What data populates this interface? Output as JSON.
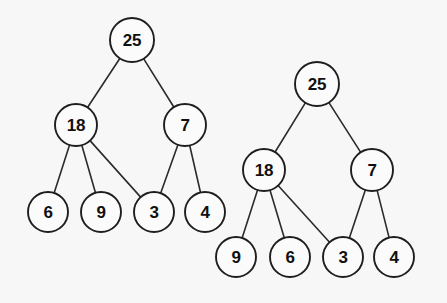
{
  "figure": {
    "background_color": "#f7f7f8",
    "node_fill_color": "#fbfbfb",
    "node_stroke_color": "#1e1e1e",
    "edge_color": "#2b2b2b",
    "width": 447,
    "height": 303
  },
  "diagrams": [
    {
      "id": "left-tree",
      "name": "left-tree",
      "nodes": [
        {
          "id": "L-root",
          "label": "25",
          "cx": 132,
          "cy": 40,
          "r": 22
        },
        {
          "id": "L-18",
          "label": "18",
          "cx": 76,
          "cy": 125,
          "r": 21
        },
        {
          "id": "L-7",
          "label": "7",
          "cx": 185,
          "cy": 125,
          "r": 21
        },
        {
          "id": "L-6",
          "label": "6",
          "cx": 48,
          "cy": 212,
          "r": 20
        },
        {
          "id": "L-9",
          "label": "9",
          "cx": 101,
          "cy": 212,
          "r": 20
        },
        {
          "id": "L-3",
          "label": "3",
          "cx": 154,
          "cy": 212,
          "r": 20
        },
        {
          "id": "L-4",
          "label": "4",
          "cx": 205,
          "cy": 212,
          "r": 20
        }
      ],
      "edges": [
        {
          "from": "L-root",
          "to": "L-18"
        },
        {
          "from": "L-root",
          "to": "L-7"
        },
        {
          "from": "L-18",
          "to": "L-6"
        },
        {
          "from": "L-18",
          "to": "L-9"
        },
        {
          "from": "L-18",
          "to": "L-3"
        },
        {
          "from": "L-7",
          "to": "L-3"
        },
        {
          "from": "L-7",
          "to": "L-4"
        }
      ]
    },
    {
      "id": "right-tree",
      "name": "right-tree",
      "nodes": [
        {
          "id": "R-root",
          "label": "25",
          "cx": 317,
          "cy": 84,
          "r": 22
        },
        {
          "id": "R-18",
          "label": "18",
          "cx": 264,
          "cy": 170,
          "r": 21
        },
        {
          "id": "R-7",
          "label": "7",
          "cx": 372,
          "cy": 170,
          "r": 21
        },
        {
          "id": "R-9",
          "label": "9",
          "cx": 236,
          "cy": 257,
          "r": 20
        },
        {
          "id": "R-6",
          "label": "6",
          "cx": 290,
          "cy": 257,
          "r": 20
        },
        {
          "id": "R-3",
          "label": "3",
          "cx": 343,
          "cy": 257,
          "r": 20
        },
        {
          "id": "R-4",
          "label": "4",
          "cx": 394,
          "cy": 257,
          "r": 20
        }
      ],
      "edges": [
        {
          "from": "R-root",
          "to": "R-18"
        },
        {
          "from": "R-root",
          "to": "R-7"
        },
        {
          "from": "R-18",
          "to": "R-9"
        },
        {
          "from": "R-18",
          "to": "R-6"
        },
        {
          "from": "R-18",
          "to": "R-3"
        },
        {
          "from": "R-7",
          "to": "R-3"
        },
        {
          "from": "R-7",
          "to": "R-4"
        }
      ]
    }
  ]
}
